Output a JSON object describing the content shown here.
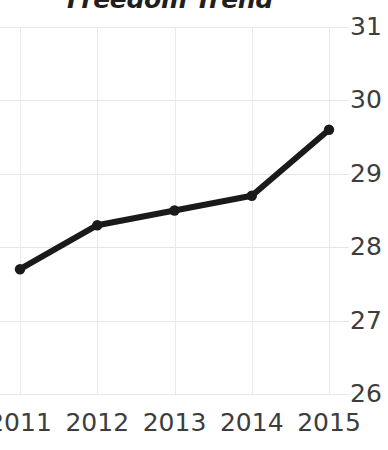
{
  "chart_data": {
    "type": "line",
    "title": "Freedom Trend",
    "xlabel": "",
    "ylabel": "",
    "categories": [
      "2011",
      "2012",
      "2013",
      "2014",
      "2015"
    ],
    "x": [
      2011,
      2012,
      2013,
      2014,
      2015
    ],
    "values": [
      27.7,
      28.3,
      28.5,
      28.7,
      29.6
    ],
    "series": [
      {
        "name": "Freedom Trend",
        "values": [
          27.7,
          28.3,
          28.5,
          28.7,
          29.6
        ]
      }
    ],
    "ylim": [
      26,
      31
    ],
    "xlim": [
      2011,
      2015
    ],
    "y_ticks": [
      31,
      30,
      29,
      28,
      27,
      26
    ],
    "x_ticks": [
      "2011",
      "2012",
      "2013",
      "2014",
      "2015"
    ],
    "grid": true,
    "legend": false,
    "legend_position": "none",
    "line_color": "#1a1a1a",
    "grid_color": "#e6e6e6",
    "axis_label_color": "#3d3d3d",
    "background_color": "#ffffff",
    "marker": "circle",
    "line_width": 6
  }
}
